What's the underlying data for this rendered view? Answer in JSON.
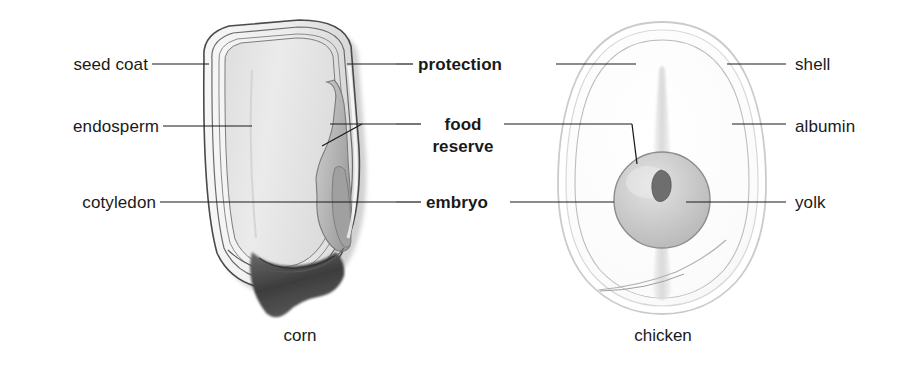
{
  "figure": {
    "title_visible": false,
    "background_color": "#ffffff",
    "line_color": "#1a1a1a",
    "specimens": [
      {
        "name": "corn",
        "caption": "corn"
      },
      {
        "name": "chicken",
        "caption": "chicken"
      }
    ]
  },
  "labels": {
    "left": [
      {
        "id": "seed-coat",
        "text": "seed coat"
      },
      {
        "id": "endosperm",
        "text": "endosperm"
      },
      {
        "id": "cotyledon",
        "text": "cotyledon"
      }
    ],
    "center": [
      {
        "id": "protection",
        "text": "protection"
      },
      {
        "id": "food-reserve",
        "text": "food",
        "text2": "reserve"
      },
      {
        "id": "embryo",
        "text": "embryo"
      }
    ],
    "right": [
      {
        "id": "shell",
        "text": "shell"
      },
      {
        "id": "albumin",
        "text": "albumin"
      },
      {
        "id": "yolk",
        "text": "yolk"
      }
    ]
  },
  "captions": {
    "corn": "corn",
    "chicken": "chicken"
  },
  "colors": {
    "outline": "#3a3a3a",
    "seed_coat_fill": "#ededed",
    "endosperm_fill": "#e2e2e2",
    "embryo_fill": "#b8b8b8",
    "tip_cap": "#4a4a4a",
    "shell_outline": "#cfcfcf",
    "albumin_fill": "#fcfcfc",
    "yolk_fill": "#c8c8c8",
    "blastodisc": "#6e6e6e"
  }
}
